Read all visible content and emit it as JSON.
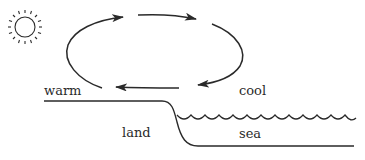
{
  "diagram": {
    "labels": {
      "warm": "warm",
      "cool": "cool",
      "land": "land",
      "sea": "sea"
    },
    "icons": {
      "sun": "sun-icon"
    },
    "colors": {
      "stroke": "#2a2a2a",
      "background": "#ffffff"
    },
    "circulation": {
      "direction": "clockwise",
      "arrows": [
        {
          "name": "rising-over-land",
          "from": "bottom-left",
          "to": "top-left"
        },
        {
          "name": "aloft-land-to-sea",
          "from": "top-left",
          "to": "top-right"
        },
        {
          "name": "sinking-over-sea",
          "from": "top-right",
          "to": "bottom-right"
        },
        {
          "name": "surface-sea-to-land",
          "from": "bottom-right",
          "to": "bottom-left"
        }
      ]
    }
  }
}
